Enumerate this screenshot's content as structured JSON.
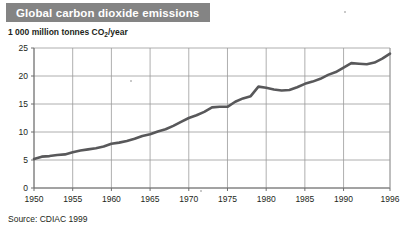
{
  "title": "Global carbon dioxide emissions",
  "subtitle_prefix": "1 000 million tonnes CO",
  "subtitle_sub": "2",
  "subtitle_suffix": "/year",
  "source": "Source: CDIAC 1999",
  "colors": {
    "banner": "#848484",
    "title_text": "#ffffff",
    "line": "#58585a",
    "grid": "#9a9a9a",
    "axis": "#6f6f6f",
    "text": "#231f20",
    "background": "#ffffff"
  },
  "chart_data": {
    "type": "line",
    "title": "Global carbon dioxide emissions",
    "xlabel": "",
    "ylabel": "1 000 million tonnes CO2/year",
    "xlim": [
      1950,
      1996
    ],
    "ylim": [
      0,
      25
    ],
    "grid": true,
    "legend": "none",
    "ytick_labels": [
      "0",
      "5",
      "10",
      "15",
      "20",
      "25"
    ],
    "ytick_values": [
      0,
      5,
      10,
      15,
      20,
      25
    ],
    "xtick_labels": [
      "1950",
      "1955",
      "1960",
      "1965",
      "1970",
      "1975",
      "1980",
      "1985",
      "1990",
      "1996"
    ],
    "xtick_values": [
      1950,
      1955,
      1960,
      1965,
      1970,
      1975,
      1980,
      1985,
      1990,
      1996
    ],
    "series": [
      {
        "name": "Global CO2 emissions",
        "x": [
          1950,
          1951,
          1952,
          1953,
          1954,
          1955,
          1956,
          1957,
          1958,
          1959,
          1960,
          1961,
          1962,
          1963,
          1964,
          1965,
          1966,
          1967,
          1968,
          1969,
          1970,
          1971,
          1972,
          1973,
          1974,
          1975,
          1976,
          1977,
          1978,
          1979,
          1980,
          1981,
          1982,
          1983,
          1984,
          1985,
          1986,
          1987,
          1988,
          1989,
          1990,
          1991,
          1992,
          1993,
          1994,
          1995,
          1996
        ],
        "values": [
          5.2,
          5.6,
          5.7,
          5.9,
          6.0,
          6.5,
          6.9,
          7.1,
          7.3,
          7.6,
          8.0,
          8.0,
          8.3,
          8.8,
          9.3,
          9.7,
          10.2,
          10.6,
          11.2,
          11.9,
          12.6,
          13.1,
          13.7,
          14.5,
          14.5,
          14.4,
          15.3,
          15.8,
          16.0,
          16.5,
          16.1,
          15.6,
          15.4,
          15.4,
          16.0,
          16.5,
          16.9,
          17.3,
          17.9,
          18.1,
          18.1,
          17.9,
          17.8,
          17.8,
          18.0,
          18.4,
          18.9
        ],
        "display_values": [
          5.2,
          5.6,
          5.7,
          5.9,
          6.0,
          6.4,
          6.7,
          6.9,
          7.1,
          7.4,
          7.9,
          8.1,
          8.4,
          8.8,
          9.3,
          9.6,
          10.1,
          10.5,
          11.1,
          11.8,
          12.5,
          13.0,
          13.6,
          14.4,
          14.5,
          14.5,
          15.4,
          16.0,
          16.4,
          18.1,
          17.9,
          17.6,
          17.4,
          17.5,
          18.0,
          18.6,
          19.0,
          19.5,
          20.2,
          20.7,
          21.5,
          22.3,
          22.2,
          22.1,
          22.4,
          23.1,
          24.0
        ]
      }
    ]
  }
}
